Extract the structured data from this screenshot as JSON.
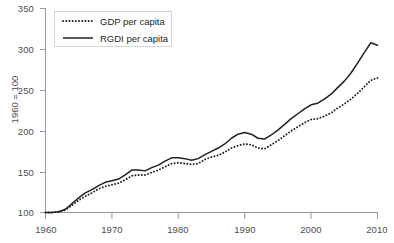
{
  "chart_data": {
    "type": "line",
    "title": "",
    "xlabel": "",
    "ylabel": "1960 = 100",
    "xlim": [
      1960,
      2010
    ],
    "ylim": [
      100,
      350
    ],
    "grid": false,
    "legend_position": "top-left",
    "x_ticks": [
      "1960",
      "1970",
      "1980",
      "1990",
      "2000",
      "2010"
    ],
    "y_ticks": [
      "100",
      "150",
      "200",
      "250",
      "300",
      "350"
    ],
    "x": [
      1960,
      1961,
      1962,
      1963,
      1964,
      1965,
      1966,
      1967,
      1968,
      1969,
      1970,
      1971,
      1972,
      1973,
      1974,
      1975,
      1976,
      1977,
      1978,
      1979,
      1980,
      1981,
      1982,
      1983,
      1984,
      1985,
      1986,
      1987,
      1988,
      1989,
      1990,
      1991,
      1992,
      1993,
      1994,
      1995,
      1996,
      1997,
      1998,
      1999,
      2000,
      2001,
      2002,
      2003,
      2004,
      2005,
      2006,
      2007,
      2008,
      2009,
      2010
    ],
    "series": [
      {
        "name": "GDP per capita",
        "style": "dotted",
        "color": "#231f20",
        "values": [
          100,
          100,
          101,
          103,
          109,
          115,
          120,
          124,
          129,
          132,
          134,
          136,
          140,
          145,
          146,
          146,
          149,
          152,
          156,
          160,
          161,
          160,
          159,
          160,
          165,
          168,
          170,
          174,
          179,
          182,
          184,
          183,
          179,
          178,
          183,
          188,
          194,
          200,
          205,
          210,
          214,
          215,
          218,
          222,
          228,
          233,
          239,
          246,
          254,
          262,
          265
        ]
      },
      {
        "name": "RGDI per capita",
        "style": "solid",
        "color": "#231f20",
        "values": [
          100,
          100,
          101,
          104,
          111,
          118,
          124,
          128,
          133,
          137,
          139,
          141,
          146,
          152,
          152,
          151,
          155,
          158,
          163,
          167,
          167,
          166,
          164,
          166,
          171,
          175,
          179,
          184,
          191,
          196,
          198,
          196,
          191,
          190,
          195,
          201,
          208,
          215,
          221,
          227,
          232,
          234,
          239,
          245,
          253,
          261,
          271,
          283,
          296,
          308,
          305
        ]
      }
    ]
  },
  "axes": {
    "y_title": "1960 = 100",
    "y_tick_labels": [
      "350",
      "300",
      "250",
      "200",
      "150",
      "100"
    ],
    "x_tick_labels": [
      "1960",
      "1970",
      "1980",
      "1990",
      "2000",
      "2010"
    ]
  },
  "legend": {
    "items": [
      {
        "label": "GDP per capita",
        "style": "dotted"
      },
      {
        "label": "RGDI per capita",
        "style": "solid"
      }
    ]
  }
}
